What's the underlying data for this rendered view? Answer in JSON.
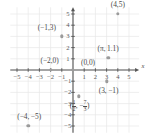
{
  "figure": {
    "type": "coordinate-plane-scatter",
    "width": 152,
    "height": 140,
    "origin_px": {
      "x": 73,
      "y": 70
    },
    "unit_px": 11.2,
    "grid": true,
    "grid_color": "#e8e8e8",
    "axis_color": "#555555",
    "point_color": "#9b9b9b",
    "label_color": "#4a4a4a",
    "x_axis_name": "x",
    "y_axis_name": "",
    "xlim": [
      -5.6,
      5.9
    ],
    "ylim": [
      -5.6,
      5.6
    ]
  },
  "ticks": {
    "x": [
      {
        "value": -5,
        "label": "−5"
      },
      {
        "value": -4,
        "label": "−4"
      },
      {
        "value": -3,
        "label": "−3"
      },
      {
        "value": -2,
        "label": "−2"
      },
      {
        "value": -1,
        "label": "−1"
      },
      {
        "value": 1,
        "label": "1"
      },
      {
        "value": 2,
        "label": "2"
      },
      {
        "value": 3,
        "label": "3"
      },
      {
        "value": 4,
        "label": "4"
      },
      {
        "value": 5,
        "label": "5"
      }
    ],
    "y": [
      {
        "value": 5,
        "label": "5"
      },
      {
        "value": 4,
        "label": "4"
      },
      {
        "value": 3,
        "label": "3"
      },
      {
        "value": 2,
        "label": "2"
      },
      {
        "value": 1,
        "label": "1"
      },
      {
        "value": -1,
        "label": "−1"
      },
      {
        "value": -2,
        "label": "−2"
      },
      {
        "value": -3,
        "label": "−3"
      },
      {
        "value": -4,
        "label": "−4"
      },
      {
        "value": -5,
        "label": "−5"
      }
    ]
  },
  "chart_data": {
    "type": "scatter",
    "title": "",
    "xlabel": "x",
    "ylabel": "",
    "xlim": [
      -5.6,
      5.9
    ],
    "ylim": [
      -5.6,
      5.6
    ],
    "grid": true,
    "legend": "none",
    "points": [
      {
        "id": "p-4-5",
        "x": 4,
        "y": 5,
        "label": "(4,5)",
        "label_dx": 0,
        "label_dy": -9
      },
      {
        "id": "p-n1-3",
        "x": -1,
        "y": 3,
        "label": "(−1,3)",
        "label_dx": -15,
        "label_dy": -8
      },
      {
        "id": "p-pi-1p1",
        "x": 3.14,
        "y": 1.1,
        "label": "(π, 1.1)",
        "label_dx": 0,
        "label_dy": -9
      },
      {
        "id": "p-n2-0",
        "x": -2,
        "y": 0,
        "label": "(−2,0)",
        "label_dx": -1,
        "label_dy": -9
      },
      {
        "id": "p-0-0",
        "x": 0,
        "y": 0,
        "label": "(0,0)",
        "label_dx": 15,
        "label_dy": -7
      },
      {
        "id": "p-3-n1",
        "x": 3,
        "y": -1,
        "label": "(3, −1)",
        "label_dx": 2,
        "label_dy": 10
      },
      {
        "id": "p-half-n73",
        "x": 0.5,
        "y": -2.3333,
        "label": "FRACTION",
        "label_dx": 1,
        "label_dy": 10
      },
      {
        "id": "p-n4-n5",
        "x": -4,
        "y": -5,
        "label": "(−4, −5)",
        "label_dx": 1,
        "label_dy": -9
      }
    ],
    "special_label": {
      "id": "p-half-n73",
      "open": "(",
      "frac1_num": "1",
      "frac1_den": "2",
      "comma": ", −",
      "frac2_num": "7",
      "frac2_den": "3",
      "close": ")"
    }
  }
}
